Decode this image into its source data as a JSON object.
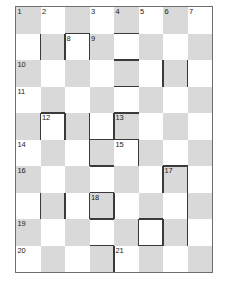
{
  "puzzle": {
    "kind": "crossword-grid",
    "title": "",
    "columns": 7,
    "rows": 10,
    "cell_size": 28,
    "colors": {
      "shaded_cell": "#d9d9d9",
      "white_cell": "#ffffff",
      "grid_border": "#6e6e6e",
      "thick_bar": "#3a3a3a",
      "number_text": "#1b1b1b",
      "page_background": "#ffffff"
    },
    "shading_rule": "checkerboard: cell shaded when (row + column) is even",
    "cells": [
      {
        "row": 0,
        "col": 0,
        "shaded": true,
        "number": "1"
      },
      {
        "row": 0,
        "col": 1,
        "shaded": false,
        "number": "2"
      },
      {
        "row": 0,
        "col": 2,
        "shaded": true,
        "number": ""
      },
      {
        "row": 0,
        "col": 3,
        "shaded": false,
        "number": "3"
      },
      {
        "row": 0,
        "col": 4,
        "shaded": true,
        "number": "4"
      },
      {
        "row": 0,
        "col": 5,
        "shaded": false,
        "number": "5"
      },
      {
        "row": 0,
        "col": 6,
        "shaded": true,
        "number": "6"
      },
      {
        "row": 0,
        "col": 7,
        "shaded": false,
        "number": "7"
      },
      {
        "row": 1,
        "col": 0,
        "shaded": false,
        "number": ""
      },
      {
        "row": 1,
        "col": 1,
        "shaded": true,
        "number": ""
      },
      {
        "row": 1,
        "col": 2,
        "shaded": false,
        "number": "8"
      },
      {
        "row": 1,
        "col": 3,
        "shaded": true,
        "number": "9"
      },
      {
        "row": 1,
        "col": 4,
        "shaded": false,
        "number": ""
      },
      {
        "row": 1,
        "col": 5,
        "shaded": true,
        "number": ""
      },
      {
        "row": 1,
        "col": 6,
        "shaded": false,
        "number": ""
      },
      {
        "row": 1,
        "col": 7,
        "shaded": true,
        "number": ""
      },
      {
        "row": 2,
        "col": 0,
        "shaded": true,
        "number": "10"
      },
      {
        "row": 2,
        "col": 1,
        "shaded": false,
        "number": ""
      },
      {
        "row": 2,
        "col": 2,
        "shaded": true,
        "number": ""
      },
      {
        "row": 2,
        "col": 3,
        "shaded": false,
        "number": ""
      },
      {
        "row": 2,
        "col": 4,
        "shaded": true,
        "number": ""
      },
      {
        "row": 2,
        "col": 5,
        "shaded": false,
        "number": ""
      },
      {
        "row": 2,
        "col": 6,
        "shaded": true,
        "number": ""
      },
      {
        "row": 2,
        "col": 7,
        "shaded": false,
        "number": ""
      },
      {
        "row": 3,
        "col": 0,
        "shaded": false,
        "number": "11"
      },
      {
        "row": 3,
        "col": 1,
        "shaded": true,
        "number": ""
      },
      {
        "row": 3,
        "col": 2,
        "shaded": false,
        "number": ""
      },
      {
        "row": 3,
        "col": 3,
        "shaded": true,
        "number": ""
      },
      {
        "row": 3,
        "col": 4,
        "shaded": false,
        "number": ""
      },
      {
        "row": 3,
        "col": 5,
        "shaded": true,
        "number": ""
      },
      {
        "row": 3,
        "col": 6,
        "shaded": false,
        "number": ""
      },
      {
        "row": 3,
        "col": 7,
        "shaded": true,
        "number": ""
      },
      {
        "row": 4,
        "col": 0,
        "shaded": true,
        "number": ""
      },
      {
        "row": 4,
        "col": 1,
        "shaded": false,
        "number": "12"
      },
      {
        "row": 4,
        "col": 2,
        "shaded": true,
        "number": ""
      },
      {
        "row": 4,
        "col": 3,
        "shaded": false,
        "number": ""
      },
      {
        "row": 4,
        "col": 4,
        "shaded": true,
        "number": "13"
      },
      {
        "row": 4,
        "col": 5,
        "shaded": false,
        "number": ""
      },
      {
        "row": 4,
        "col": 6,
        "shaded": true,
        "number": ""
      },
      {
        "row": 4,
        "col": 7,
        "shaded": false,
        "number": ""
      },
      {
        "row": 5,
        "col": 0,
        "shaded": false,
        "number": "14"
      },
      {
        "row": 5,
        "col": 1,
        "shaded": true,
        "number": ""
      },
      {
        "row": 5,
        "col": 2,
        "shaded": false,
        "number": ""
      },
      {
        "row": 5,
        "col": 3,
        "shaded": true,
        "number": ""
      },
      {
        "row": 5,
        "col": 4,
        "shaded": false,
        "number": "15"
      },
      {
        "row": 5,
        "col": 5,
        "shaded": true,
        "number": ""
      },
      {
        "row": 5,
        "col": 6,
        "shaded": false,
        "number": ""
      },
      {
        "row": 5,
        "col": 7,
        "shaded": true,
        "number": ""
      },
      {
        "row": 6,
        "col": 0,
        "shaded": true,
        "number": "16"
      },
      {
        "row": 6,
        "col": 1,
        "shaded": false,
        "number": ""
      },
      {
        "row": 6,
        "col": 2,
        "shaded": true,
        "number": ""
      },
      {
        "row": 6,
        "col": 3,
        "shaded": false,
        "number": ""
      },
      {
        "row": 6,
        "col": 4,
        "shaded": true,
        "number": ""
      },
      {
        "row": 6,
        "col": 5,
        "shaded": false,
        "number": ""
      },
      {
        "row": 6,
        "col": 6,
        "shaded": true,
        "number": "17"
      },
      {
        "row": 6,
        "col": 7,
        "shaded": false,
        "number": ""
      },
      {
        "row": 7,
        "col": 0,
        "shaded": false,
        "number": ""
      },
      {
        "row": 7,
        "col": 1,
        "shaded": true,
        "number": ""
      },
      {
        "row": 7,
        "col": 2,
        "shaded": false,
        "number": ""
      },
      {
        "row": 7,
        "col": 3,
        "shaded": true,
        "number": "18"
      },
      {
        "row": 7,
        "col": 4,
        "shaded": false,
        "number": ""
      },
      {
        "row": 7,
        "col": 5,
        "shaded": true,
        "number": ""
      },
      {
        "row": 7,
        "col": 6,
        "shaded": false,
        "number": ""
      },
      {
        "row": 7,
        "col": 7,
        "shaded": true,
        "number": ""
      },
      {
        "row": 8,
        "col": 0,
        "shaded": true,
        "number": "19"
      },
      {
        "row": 8,
        "col": 1,
        "shaded": false,
        "number": ""
      },
      {
        "row": 8,
        "col": 2,
        "shaded": true,
        "number": ""
      },
      {
        "row": 8,
        "col": 3,
        "shaded": false,
        "number": ""
      },
      {
        "row": 8,
        "col": 4,
        "shaded": true,
        "number": ""
      },
      {
        "row": 8,
        "col": 5,
        "shaded": false,
        "number": ""
      },
      {
        "row": 8,
        "col": 6,
        "shaded": true,
        "number": ""
      },
      {
        "row": 8,
        "col": 7,
        "shaded": false,
        "number": ""
      },
      {
        "row": 9,
        "col": 0,
        "shaded": false,
        "number": "20"
      },
      {
        "row": 9,
        "col": 1,
        "shaded": true,
        "number": ""
      },
      {
        "row": 9,
        "col": 2,
        "shaded": false,
        "number": ""
      },
      {
        "row": 9,
        "col": 3,
        "shaded": true,
        "number": ""
      },
      {
        "row": 9,
        "col": 4,
        "shaded": false,
        "number": "21"
      },
      {
        "row": 9,
        "col": 5,
        "shaded": true,
        "number": ""
      },
      {
        "row": 9,
        "col": 6,
        "shaded": false,
        "number": ""
      },
      {
        "row": 9,
        "col": 7,
        "shaded": true,
        "number": ""
      }
    ],
    "thick_bars": [
      {
        "orient": "h",
        "row": 1,
        "col": 4,
        "len": 1
      },
      {
        "orient": "h",
        "row": 1,
        "col": 2,
        "len": 1
      },
      {
        "orient": "v",
        "row": 1,
        "col": 1,
        "len": 1
      },
      {
        "orient": "v",
        "row": 1,
        "col": 2,
        "len": 1
      },
      {
        "orient": "v",
        "row": 1,
        "col": 3,
        "len": 1
      },
      {
        "orient": "h",
        "row": 2,
        "col": 4,
        "len": 1
      },
      {
        "orient": "h",
        "row": 3,
        "col": 4,
        "len": 1
      },
      {
        "orient": "v",
        "row": 2,
        "col": 6,
        "len": 1
      },
      {
        "orient": "v",
        "row": 2,
        "col": 7,
        "len": 1
      },
      {
        "orient": "h",
        "row": 4,
        "col": 1,
        "len": 1
      },
      {
        "orient": "h",
        "row": 4,
        "col": 4,
        "len": 1
      },
      {
        "orient": "v",
        "row": 4,
        "col": 1,
        "len": 1
      },
      {
        "orient": "v",
        "row": 4,
        "col": 2,
        "len": 1
      },
      {
        "orient": "v",
        "row": 4,
        "col": 3,
        "len": 2
      },
      {
        "orient": "v",
        "row": 4,
        "col": 4,
        "len": 1
      },
      {
        "orient": "h",
        "row": 5,
        "col": 3,
        "len": 2
      },
      {
        "orient": "v",
        "row": 5,
        "col": 5,
        "len": 1
      },
      {
        "orient": "h",
        "row": 6,
        "col": 3,
        "len": 1
      },
      {
        "orient": "h",
        "row": 6,
        "col": 6,
        "len": 1
      },
      {
        "orient": "v",
        "row": 6,
        "col": 6,
        "len": 1
      },
      {
        "orient": "v",
        "row": 6,
        "col": 7,
        "len": 1
      },
      {
        "orient": "h",
        "row": 7,
        "col": 3,
        "len": 1
      },
      {
        "orient": "v",
        "row": 7,
        "col": 1,
        "len": 1
      },
      {
        "orient": "v",
        "row": 7,
        "col": 2,
        "len": 1
      },
      {
        "orient": "v",
        "row": 7,
        "col": 3,
        "len": 1
      },
      {
        "orient": "v",
        "row": 7,
        "col": 4,
        "len": 1
      },
      {
        "orient": "v",
        "row": 7,
        "col": 7,
        "len": 1
      },
      {
        "orient": "h",
        "row": 8,
        "col": 3,
        "len": 1
      },
      {
        "orient": "h",
        "row": 8,
        "col": 5,
        "len": 1
      },
      {
        "orient": "v",
        "row": 8,
        "col": 5,
        "len": 1
      },
      {
        "orient": "v",
        "row": 8,
        "col": 6,
        "len": 1
      },
      {
        "orient": "v",
        "row": 8,
        "col": 7,
        "len": 1
      },
      {
        "orient": "h",
        "row": 9,
        "col": 3,
        "len": 1
      },
      {
        "orient": "h",
        "row": 9,
        "col": 5,
        "len": 1
      },
      {
        "orient": "v",
        "row": 9,
        "col": 4,
        "len": 1
      }
    ]
  }
}
